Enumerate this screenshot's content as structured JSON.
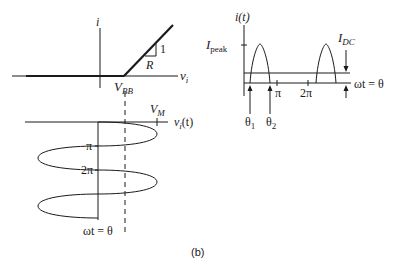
{
  "figure": {
    "caption": "(b)"
  },
  "transfer_plot": {
    "y_axis_label": "i",
    "x_axis_label": "v",
    "x_axis_sub": "i",
    "threshold_label": "V",
    "threshold_sub": "BB",
    "slope_rise": "1",
    "slope_run": "R"
  },
  "input_waveform": {
    "axis_label": "v",
    "axis_sub": "i",
    "axis_suffix": "(t)",
    "amplitude_label": "V",
    "amplitude_sub": "M",
    "tick_pi": "π",
    "tick_2pi": "2π",
    "time_axis_label": "ωt = θ"
  },
  "current_plot": {
    "y_axis_label": "i(t)",
    "peak_label": "I",
    "peak_sub": "peak",
    "dc_label": "I",
    "dc_sub": "DC",
    "x_axis_label": "ωt = θ",
    "tick_pi": "π",
    "tick_2pi": "2π",
    "theta1": "θ",
    "theta1_sub": "1",
    "theta2": "θ",
    "theta2_sub": "2"
  }
}
